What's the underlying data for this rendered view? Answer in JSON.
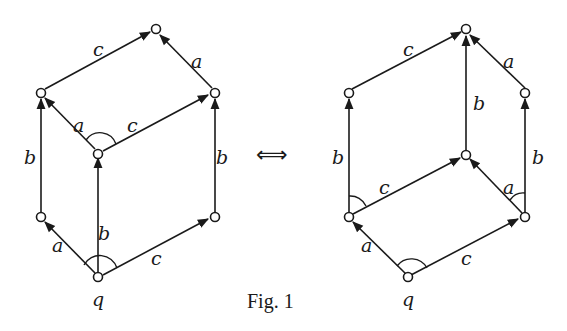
{
  "figure": {
    "caption": "Fig. 1",
    "equivalence_symbol": "⟺",
    "left_diagram": {
      "start_label": "q",
      "edge_labels": {
        "top_c": "c",
        "top_a": "a",
        "mid_a": "a",
        "mid_c": "c",
        "left_b": "b",
        "center_b": "b",
        "right_b": "b",
        "bottom_a": "a",
        "bottom_c": "c"
      }
    },
    "right_diagram": {
      "start_label": "q",
      "edge_labels": {
        "top_c": "c",
        "top_a": "a",
        "center_b": "b",
        "left_b": "b",
        "right_b": "b",
        "mid_c": "c",
        "mid_a": "a",
        "bottom_a": "a",
        "bottom_c": "c"
      }
    }
  }
}
